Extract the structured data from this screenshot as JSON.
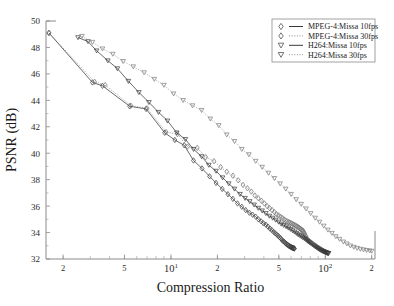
{
  "chart_data": {
    "type": "line",
    "title": "",
    "xlabel": "Compression Ratio",
    "ylabel": "PSNR (dB)",
    "xscale": "log",
    "yscale": "linear",
    "xlim": [
      1.55,
      210
    ],
    "ylim": [
      32,
      50
    ],
    "grid": false,
    "legend_position": "top-right",
    "y_ticks": [
      32,
      34,
      36,
      38,
      40,
      42,
      44,
      46,
      48,
      50
    ],
    "y_tick_labels": [
      "32",
      "34",
      "36",
      "38",
      "40",
      "42",
      "44",
      "46",
      "48",
      "50"
    ],
    "x_ticks": [
      2,
      5,
      10,
      20,
      50,
      100,
      200
    ],
    "x_tick_labels": [
      "2",
      "5",
      "10^1",
      "2",
      "5",
      "10^2",
      "2"
    ],
    "series": [
      {
        "name": "MPEG-4:Missa 10fps",
        "marker": "diamond",
        "linestyle": "solid",
        "color": "#3a3a3a",
        "x": [
          1.62,
          3.1,
          3.6,
          5.4,
          6.9,
          9.1,
          10.6,
          12.2,
          14.0,
          15.9,
          17.8,
          19.6,
          21.5,
          23.4,
          25.2,
          27.0,
          28.8,
          30.5,
          32.2,
          33.8,
          35.4,
          36.9,
          38.4,
          39.8,
          41.2,
          42.5,
          43.8,
          45.0,
          46.2,
          47.3,
          48.4,
          49.5,
          50.5,
          51.5,
          52.4,
          53.3,
          54.2,
          55.0,
          55.8,
          56.6,
          57.3,
          58.0,
          58.7,
          59.3,
          59.9,
          60.5,
          61.0,
          61.5,
          62.0,
          62.4,
          62.8,
          63.1
        ],
        "y": [
          49.1,
          45.35,
          45.1,
          43.55,
          43.35,
          41.55,
          41.0,
          40.6,
          39.45,
          38.85,
          38.25,
          37.75,
          37.3,
          36.9,
          36.55,
          36.2,
          35.95,
          35.7,
          35.5,
          35.35,
          35.2,
          35.0,
          34.85,
          34.7,
          34.6,
          34.45,
          34.3,
          34.2,
          34.05,
          33.95,
          33.85,
          33.75,
          33.65,
          33.55,
          33.45,
          33.35,
          33.3,
          33.22,
          33.15,
          33.1,
          33.05,
          33.0,
          32.97,
          32.94,
          32.91,
          32.88,
          32.86,
          32.84,
          32.82,
          32.81,
          32.8,
          32.79
        ]
      },
      {
        "name": "MPEG-4:Missa 30fps",
        "marker": "diamond",
        "linestyle": "dotted",
        "color": "#6e6e6e",
        "x": [
          1.62,
          3.2,
          3.75,
          5.5,
          7.0,
          9.3,
          11.0,
          12.8,
          14.8,
          16.8,
          19.0,
          21.0,
          23.0,
          25.2,
          27.3,
          29.3,
          31.3,
          33.2,
          35.0,
          36.8,
          38.6,
          40.3,
          42.0,
          43.6,
          45.2,
          46.8,
          48.3,
          49.8,
          51.2,
          52.6,
          54.0,
          55.3,
          56.6,
          57.9,
          59.1,
          60.3,
          61.5,
          62.6,
          63.7,
          64.8,
          65.8,
          66.8,
          67.8,
          68.7,
          69.6,
          70.5,
          71.3,
          72.1,
          72.8,
          73.5,
          74.2,
          75.0,
          76.0,
          77.5,
          79.0
        ],
        "y": [
          49.1,
          45.4,
          45.15,
          43.6,
          43.4,
          41.6,
          41.45,
          40.5,
          40.4,
          39.7,
          39.4,
          38.95,
          38.6,
          38.3,
          37.95,
          37.6,
          37.35,
          37.1,
          36.8,
          36.6,
          36.4,
          36.2,
          36.0,
          35.85,
          35.7,
          35.55,
          35.4,
          35.3,
          35.2,
          35.1,
          35.0,
          34.92,
          34.85,
          34.8,
          34.75,
          34.7,
          34.65,
          34.6,
          34.55,
          34.5,
          34.45,
          34.4,
          34.35,
          34.3,
          34.25,
          34.2,
          34.15,
          34.1,
          34.0,
          33.9,
          33.8,
          33.7,
          33.55,
          33.4,
          33.3
        ]
      },
      {
        "name": "H264:Missa 10fps",
        "marker": "triangle-down",
        "linestyle": "solid",
        "color": "#3a3a3a",
        "x": [
          2.5,
          2.9,
          3.3,
          3.9,
          4.5,
          5.3,
          6.2,
          7.2,
          8.3,
          9.5,
          10.9,
          12.4,
          14.0,
          15.8,
          17.6,
          19.6,
          21.6,
          23.7,
          25.8,
          28.0,
          30.2,
          32.4,
          34.6,
          36.8,
          39.0,
          41.2,
          43.4,
          45.6,
          47.7,
          49.8,
          51.8,
          53.8,
          55.8,
          57.7,
          59.6,
          61.4,
          63.2,
          65.0,
          66.7,
          68.4,
          70.0,
          71.6,
          73.2,
          74.7,
          76.2,
          77.6,
          79.0,
          80.4,
          81.7,
          83.0,
          84.3,
          85.5,
          86.7,
          87.9,
          89.0,
          90.1,
          91.2,
          92.3,
          93.3,
          94.3,
          95.3,
          96.3,
          97.2,
          98.1,
          99.0,
          99.9,
          100.7,
          101.5,
          102.3,
          103.0,
          103.7,
          104.4,
          105.0
        ],
        "y": [
          48.75,
          48.45,
          47.75,
          47.0,
          46.4,
          45.45,
          44.6,
          43.85,
          43.1,
          42.45,
          41.55,
          41.05,
          40.3,
          39.75,
          39.1,
          38.65,
          38.15,
          37.7,
          37.3,
          36.9,
          36.6,
          36.35,
          36.1,
          35.85,
          35.65,
          35.45,
          35.25,
          35.1,
          34.95,
          34.8,
          34.65,
          34.55,
          34.45,
          34.35,
          34.25,
          34.15,
          34.05,
          33.95,
          33.85,
          33.78,
          33.7,
          33.62,
          33.55,
          33.48,
          33.4,
          33.33,
          33.27,
          33.2,
          33.14,
          33.08,
          33.02,
          32.97,
          32.92,
          32.87,
          32.83,
          32.79,
          32.75,
          32.71,
          32.68,
          32.65,
          32.62,
          32.59,
          32.57,
          32.55,
          32.53,
          32.51,
          32.49,
          32.47,
          32.46,
          32.45,
          32.44,
          32.43,
          32.42
        ]
      },
      {
        "name": "H264:Missa 30fps",
        "marker": "triangle-down",
        "linestyle": "dotted",
        "color": "#7a7a7a",
        "x": [
          2.65,
          3.1,
          3.6,
          4.2,
          4.9,
          5.7,
          6.7,
          7.8,
          9.0,
          10.4,
          12.0,
          13.8,
          15.8,
          18.0,
          20.4,
          23.0,
          25.8,
          28.8,
          32.0,
          35.4,
          39.0,
          42.8,
          46.8,
          51.0,
          55.4,
          60.0,
          64.8,
          69.8,
          75.0,
          80.4,
          86.0,
          91.8,
          97.8,
          104.0,
          110.4,
          117.0,
          123.8,
          130.8,
          138.0,
          145.4,
          153.0,
          160.8,
          168.8,
          177.0,
          185.4,
          194.0,
          200.0
        ],
        "y": [
          48.85,
          48.4,
          47.9,
          47.5,
          46.95,
          46.55,
          46.1,
          45.6,
          45.15,
          44.5,
          44.0,
          43.6,
          43.25,
          42.6,
          42.1,
          41.4,
          40.9,
          40.3,
          39.9,
          39.4,
          38.95,
          38.5,
          38.1,
          37.7,
          37.3,
          36.9,
          36.5,
          36.15,
          35.8,
          35.45,
          35.1,
          34.8,
          34.5,
          34.2,
          33.95,
          33.7,
          33.5,
          33.3,
          33.15,
          33.0,
          32.9,
          32.82,
          32.75,
          32.7,
          32.66,
          32.62,
          32.6
        ]
      }
    ]
  },
  "legend": {
    "entries": [
      {
        "label": "MPEG-4:Missa 10fps"
      },
      {
        "label": "MPEG-4:Missa 30fps"
      },
      {
        "label": "H264:Missa 10fps"
      },
      {
        "label": "H264:Missa 30fps"
      }
    ]
  }
}
